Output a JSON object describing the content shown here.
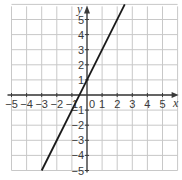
{
  "chart_data": {
    "type": "line",
    "title": "",
    "xlabel": "x",
    "ylabel": "y",
    "xlim": [
      -5,
      6
    ],
    "ylim": [
      -5,
      6
    ],
    "grid": true,
    "x_ticks": [
      "-5",
      "-4",
      "-3",
      "-2",
      "-1",
      "0",
      "1",
      "2",
      "3",
      "4",
      "5"
    ],
    "y_ticks": [
      "5",
      "4",
      "3",
      "2",
      "1",
      "-1",
      "-2",
      "-3",
      "-4",
      "-5"
    ],
    "origin_label": "0",
    "series": [
      {
        "name": "y = 2x + 1",
        "equation": "y = 2x + 1",
        "x": [
          -3,
          2.5
        ],
        "y": [
          -5,
          6
        ]
      }
    ]
  },
  "colors": {
    "grid": "#c8c8c8",
    "axis": "#3a3a3a",
    "line": "#1a1a1a"
  }
}
